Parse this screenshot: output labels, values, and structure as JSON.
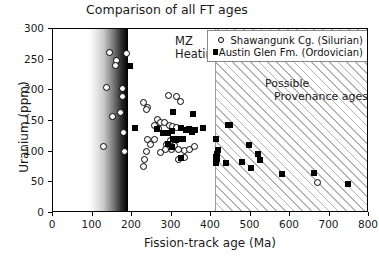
{
  "chart_data": {
    "type": "scatter",
    "title": "Comparison of all FT ages",
    "xlabel": "Fission-track age (Ma)",
    "ylabel": "Uranium (ppm)",
    "xlim": [
      0,
      800
    ],
    "ylim": [
      0,
      300
    ],
    "xticks": [
      0,
      100,
      200,
      300,
      400,
      500,
      600,
      700,
      800
    ],
    "yticks": [
      0,
      50,
      100,
      150,
      200,
      250,
      300
    ],
    "grid": false,
    "legend_position": "top-right",
    "series": [
      {
        "name": "Shawangunk Cg. (Silurian)",
        "marker": "open-circle",
        "color": "#000000",
        "points": [
          [
            143,
            261
          ],
          [
            186,
            260
          ],
          [
            160,
            248
          ],
          [
            157,
            240
          ],
          [
            136,
            205
          ],
          [
            176,
            203
          ],
          [
            176,
            190
          ],
          [
            150,
            158
          ],
          [
            172,
            164
          ],
          [
            127,
            109
          ],
          [
            178,
            132
          ],
          [
            180,
            101
          ],
          [
            228,
            180
          ],
          [
            238,
            172
          ],
          [
            237,
            168
          ],
          [
            292,
            192
          ],
          [
            312,
            190
          ],
          [
            322,
            181
          ],
          [
            265,
            152
          ],
          [
            272,
            148
          ],
          [
            283,
            147
          ],
          [
            295,
            143
          ],
          [
            257,
            142
          ],
          [
            268,
            138
          ],
          [
            303,
            141
          ],
          [
            312,
            139
          ],
          [
            240,
            120
          ],
          [
            258,
            120
          ],
          [
            297,
            118
          ],
          [
            310,
            120
          ],
          [
            247,
            111
          ],
          [
            288,
            112
          ],
          [
            307,
            110
          ],
          [
            236,
            101
          ],
          [
            285,
            103
          ],
          [
            300,
            104
          ],
          [
            318,
            103
          ],
          [
            332,
            102
          ],
          [
            345,
            104
          ],
          [
            358,
            108
          ],
          [
            232,
            87
          ],
          [
            228,
            76
          ],
          [
            272,
            98
          ],
          [
            318,
            88
          ],
          [
            333,
            90
          ],
          [
            670,
            50
          ]
        ]
      },
      {
        "name": "Austin Glen Fm. (Ordovician)",
        "marker": "filled-square",
        "color": "#000000",
        "points": [
          [
            196,
            240
          ],
          [
            305,
            165
          ],
          [
            355,
            162
          ],
          [
            207,
            138
          ],
          [
            263,
            137
          ],
          [
            278,
            131
          ],
          [
            290,
            130
          ],
          [
            300,
            133
          ],
          [
            312,
            119
          ],
          [
            323,
            139
          ],
          [
            337,
            135
          ],
          [
            345,
            137
          ],
          [
            352,
            132
          ],
          [
            360,
            136
          ],
          [
            380,
            138
          ],
          [
            318,
            121
          ],
          [
            330,
            120
          ],
          [
            305,
            120
          ],
          [
            290,
            113
          ],
          [
            300,
            108
          ],
          [
            325,
            89
          ],
          [
            412,
            121
          ],
          [
            418,
            103
          ],
          [
            415,
            96
          ],
          [
            413,
            92
          ],
          [
            414,
            88
          ],
          [
            412,
            81
          ],
          [
            437,
            81
          ],
          [
            447,
            143
          ],
          [
            443,
            144
          ],
          [
            478,
            83
          ],
          [
            497,
            111
          ],
          [
            500,
            74
          ],
          [
            518,
            97
          ],
          [
            524,
            86
          ],
          [
            581,
            64
          ],
          [
            662,
            65
          ],
          [
            748,
            48
          ]
        ]
      }
    ],
    "shaded_regions": [
      {
        "name": "MZ Heating",
        "label": [
          "MZ",
          "Heating"
        ],
        "x_start": 90,
        "x_end": 190,
        "style": "gradient-white-to-black"
      },
      {
        "name": "Possible Provenance ages",
        "label": [
          "Possible",
          "Provenance ages"
        ],
        "x_start": 410,
        "x_end": 800,
        "style": "diagonal-hatch"
      }
    ]
  },
  "legend": {
    "entries": [
      {
        "label": "Shawangunk Cg. (Silurian)",
        "marker": "open-circle"
      },
      {
        "label": "Austin Glen Fm. (Ordovician)",
        "marker": "filled-square"
      }
    ]
  },
  "annotations": {
    "mz_line1": "MZ",
    "mz_line2": "Heating",
    "prov_line1": "Possible",
    "prov_line2": "Provenance ages"
  }
}
